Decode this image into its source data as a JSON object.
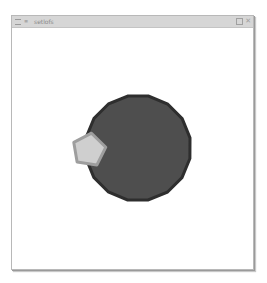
{
  "window": {
    "title": "setlofs",
    "menu_icon": "window-menu-icon",
    "controls": {
      "maximize_icon": "maximize-icon",
      "close_label": "✕"
    }
  },
  "scene": {
    "circle": {
      "cx": 138,
      "cy": 148,
      "r": 53,
      "fill": "#4e4e4e",
      "stroke": "#2e2e2e"
    },
    "pentagon": {
      "cx": 89,
      "cy": 150,
      "r": 17,
      "fill": "#cfcfcf",
      "stroke": "#9e9e9e"
    }
  }
}
